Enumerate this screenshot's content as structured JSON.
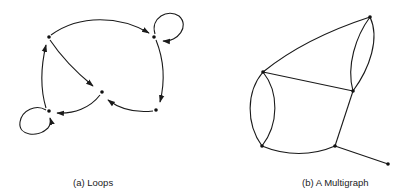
{
  "figure": {
    "panels": [
      {
        "id": "a",
        "caption": "(a) Loops",
        "type": "directed graph with loops",
        "nodes": [
          {
            "id": "A",
            "x": 49,
            "y": 37
          },
          {
            "id": "B",
            "x": 154,
            "y": 37
          },
          {
            "id": "C",
            "x": 102,
            "y": 92
          },
          {
            "id": "D",
            "x": 49,
            "y": 111
          },
          {
            "id": "E",
            "x": 156,
            "y": 110
          }
        ],
        "edges": [
          {
            "from": "A",
            "to": "B",
            "directed": true
          },
          {
            "from": "A",
            "to": "C",
            "directed": true
          },
          {
            "from": "B",
            "to": "B",
            "directed": true,
            "loop": true
          },
          {
            "from": "B",
            "to": "E",
            "directed": true
          },
          {
            "from": "E",
            "to": "C",
            "directed": true
          },
          {
            "from": "C",
            "to": "D",
            "directed": true
          },
          {
            "from": "D",
            "to": "A",
            "directed": true
          },
          {
            "from": "D",
            "to": "D",
            "directed": true,
            "loop": true
          }
        ]
      },
      {
        "id": "b",
        "caption": "(b) A Multigraph",
        "type": "undirected multigraph",
        "nodes": [
          {
            "id": "P",
            "x": 263,
            "y": 72
          },
          {
            "id": "Q",
            "x": 370,
            "y": 17
          },
          {
            "id": "R",
            "x": 353,
            "y": 91
          },
          {
            "id": "S",
            "x": 262,
            "y": 146
          },
          {
            "id": "T",
            "x": 335,
            "y": 146
          },
          {
            "id": "U",
            "x": 388,
            "y": 164
          }
        ],
        "edges": [
          {
            "from": "P",
            "to": "Q"
          },
          {
            "from": "P",
            "to": "R"
          },
          {
            "from": "Q",
            "to": "R"
          },
          {
            "from": "Q",
            "to": "R"
          },
          {
            "from": "P",
            "to": "S"
          },
          {
            "from": "P",
            "to": "S"
          },
          {
            "from": "S",
            "to": "T"
          },
          {
            "from": "T",
            "to": "R"
          },
          {
            "from": "T",
            "to": "U"
          }
        ]
      }
    ],
    "colors": {
      "background": "#ffffff",
      "stroke": "#1a1a1a",
      "node": "#111111",
      "text": "#222222"
    }
  }
}
